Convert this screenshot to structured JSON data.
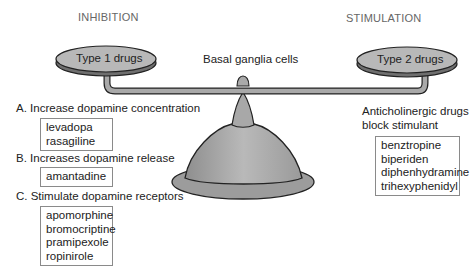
{
  "headings": {
    "inhibition": "INHIBITION",
    "stimulation": "STIMULATION"
  },
  "scale": {
    "left_pan": "Type 1 drugs",
    "right_pan": "Type 2 drugs",
    "center_label": "Basal ganglia cells"
  },
  "left": {
    "groups": [
      {
        "title": "A. Increase dopamine concentration",
        "drugs": [
          "levadopa",
          "rasagiline"
        ]
      },
      {
        "title": "B. Increases dopamine release",
        "drugs": [
          "amantadine"
        ]
      },
      {
        "title": "C. Stimulate dopamine receptors",
        "drugs": [
          "apomorphine",
          "bromocriptine",
          "pramipexole",
          "ropinirole"
        ]
      }
    ]
  },
  "right": {
    "title_line1": "Anticholinergic drugs",
    "title_line2": "block stimulant",
    "drugs": [
      "benztropine",
      "biperiden",
      "diphenhydramine",
      "trihexyphenidyl"
    ]
  },
  "colors": {
    "pan_fill": "#b5b5b5",
    "pan_shadow": "#6f6f6f",
    "beam_fill": "#a9a9a9",
    "base_fill": "#9e9e9e",
    "outline": "#222222"
  }
}
